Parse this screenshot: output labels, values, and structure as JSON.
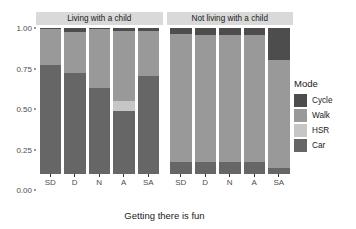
{
  "chart_data": {
    "type": "bar",
    "title": "",
    "subtitle": "",
    "xlabel": "Getting there is fun",
    "ylabel": "Proportion",
    "ylim": [
      0,
      1
    ],
    "ytick_labels": [
      "0.00",
      "0.25",
      "0.50",
      "0.75",
      "1.00"
    ],
    "ytick_values": [
      0,
      0.25,
      0.5,
      0.75,
      1.0
    ],
    "grid": false,
    "stacked": true,
    "stack_order_bottom_to_top": [
      "Car",
      "HSR",
      "Walk",
      "Cycle"
    ],
    "legend": {
      "title": "Mode",
      "position": "right",
      "entries": [
        {
          "label": "Cycle",
          "color": "#4d4d4d"
        },
        {
          "label": "Walk",
          "color": "#999999"
        },
        {
          "label": "HSR",
          "color": "#c6c6c6"
        },
        {
          "label": "Car",
          "color": "#666666"
        }
      ]
    },
    "facet_variable": "Household",
    "facets": [
      {
        "label": "Living with a child",
        "categories": [
          "SD",
          "D",
          "N",
          "A",
          "SA"
        ],
        "series": [
          {
            "name": "Car",
            "color": "#666666",
            "values": [
              0.75,
              0.69,
              0.59,
              0.43,
              0.67
            ]
          },
          {
            "name": "HSR",
            "color": "#c6c6c6",
            "values": [
              0.0,
              0.0,
              0.0,
              0.07,
              0.0
            ]
          },
          {
            "name": "Walk",
            "color": "#999999",
            "values": [
              0.24,
              0.28,
              0.4,
              0.48,
              0.31
            ]
          },
          {
            "name": "Cycle",
            "color": "#4d4d4d",
            "values": [
              0.01,
              0.03,
              0.01,
              0.02,
              0.02
            ]
          }
        ]
      },
      {
        "label": "Not living with a child",
        "categories": [
          "SD",
          "D",
          "N",
          "A",
          "SA"
        ],
        "series": [
          {
            "name": "Car",
            "color": "#666666",
            "values": [
              0.08,
              0.08,
              0.08,
              0.08,
              0.04
            ]
          },
          {
            "name": "HSR",
            "color": "#c6c6c6",
            "values": [
              0.0,
              0.0,
              0.0,
              0.0,
              0.0
            ]
          },
          {
            "name": "Walk",
            "color": "#999999",
            "values": [
              0.88,
              0.87,
              0.87,
              0.87,
              0.74
            ]
          },
          {
            "name": "Cycle",
            "color": "#4d4d4d",
            "values": [
              0.04,
              0.05,
              0.05,
              0.05,
              0.22
            ]
          }
        ]
      }
    ]
  },
  "axis": {
    "y_title": "Proportion",
    "x_title": "Getting there is fun"
  },
  "legend": {
    "title": "Mode"
  }
}
